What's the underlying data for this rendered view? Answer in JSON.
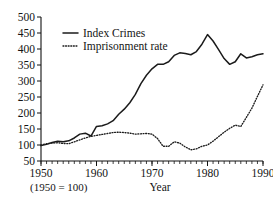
{
  "chart_data": {
    "type": "line",
    "title": "",
    "xlabel": "Year",
    "ylabel": "",
    "note": "(1950 = 100)",
    "xlim": [
      1950,
      1990
    ],
    "ylim": [
      50,
      500
    ],
    "grid": false,
    "legend_position": "top-left",
    "ytick_labels": [
      "50",
      "100",
      "150",
      "200",
      "250",
      "300",
      "350",
      "400",
      "450",
      "500"
    ],
    "ytick_values": [
      50,
      100,
      150,
      200,
      250,
      300,
      350,
      400,
      450,
      500
    ],
    "xtick_labels": [
      "1950",
      "1960",
      "1970",
      "1980",
      "1990"
    ],
    "xtick_values": [
      1950,
      1960,
      1970,
      1980,
      1990
    ],
    "xtick_minor_step": 1,
    "x": [
      1950,
      1951,
      1952,
      1953,
      1954,
      1955,
      1956,
      1957,
      1958,
      1959,
      1960,
      1961,
      1962,
      1963,
      1964,
      1965,
      1966,
      1967,
      1968,
      1969,
      1970,
      1971,
      1972,
      1973,
      1974,
      1975,
      1976,
      1977,
      1978,
      1979,
      1980,
      1981,
      1982,
      1983,
      1984,
      1985,
      1986,
      1987,
      1988,
      1989,
      1990
    ],
    "series": [
      {
        "name": "Index Crimes",
        "style": "solid",
        "color": "#1b1b1b",
        "values": [
          98,
          102,
          108,
          112,
          110,
          113,
          122,
          134,
          137,
          128,
          158,
          160,
          166,
          176,
          196,
          212,
          232,
          258,
          292,
          318,
          338,
          352,
          352,
          360,
          380,
          388,
          386,
          382,
          392,
          415,
          445,
          425,
          398,
          370,
          352,
          360,
          385,
          372,
          376,
          382,
          385
        ]
      },
      {
        "name": "Imprisonment rate",
        "style": "dotted",
        "color": "#1b1b1b",
        "values": [
          100,
          104,
          106,
          107,
          105,
          104,
          110,
          116,
          122,
          127,
          130,
          133,
          136,
          139,
          140,
          139,
          137,
          134,
          135,
          136,
          134,
          120,
          96,
          96,
          110,
          106,
          94,
          85,
          88,
          96,
          100,
          112,
          126,
          140,
          152,
          162,
          158,
          186,
          215,
          252,
          288
        ]
      }
    ]
  },
  "legend": {
    "items": [
      {
        "label": "Index Crimes",
        "style": "solid"
      },
      {
        "label": "Imprisonment rate",
        "style": "dotted"
      }
    ]
  }
}
